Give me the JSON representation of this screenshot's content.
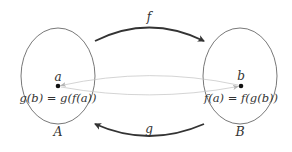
{
  "diagram": {
    "type": "function-mapping",
    "sets": [
      {
        "id": "A",
        "label": "A",
        "cx": 58,
        "cy": 76,
        "rx": 37,
        "ry": 48
      },
      {
        "id": "B",
        "label": "B",
        "cx": 240,
        "cy": 76,
        "rx": 37,
        "ry": 48
      }
    ],
    "points": [
      {
        "id": "a",
        "label": "a",
        "set": "A",
        "x": 58,
        "y": 86
      },
      {
        "id": "b",
        "label": "b",
        "set": "B",
        "x": 241,
        "y": 86
      }
    ],
    "equations": {
      "left": "g(b) = g(f(a))",
      "right": "f(a) = f(g(b))"
    },
    "maps": [
      {
        "id": "f",
        "label": "f",
        "from": "A",
        "to": "B",
        "position": "top"
      },
      {
        "id": "g",
        "label": "g",
        "from": "B",
        "to": "A",
        "position": "bottom"
      }
    ],
    "element_arrows": [
      {
        "from": "b",
        "to": "a",
        "position": "upper",
        "style": "thin-gray"
      },
      {
        "from": "a",
        "to": "b",
        "position": "lower",
        "style": "thin-gray"
      }
    ],
    "colors": {
      "ellipse": "#555555",
      "map_arrow": "#333333",
      "element_arrow": "#bbbbbb",
      "point": "#111111",
      "text": "#333333"
    }
  }
}
